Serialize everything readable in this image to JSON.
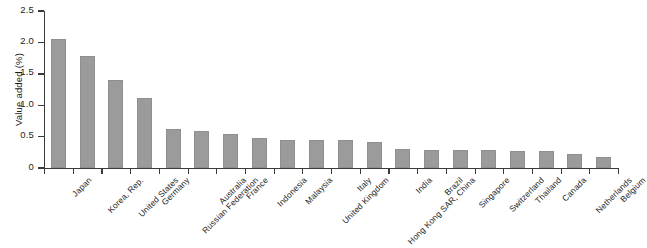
{
  "chart_data": {
    "type": "bar",
    "title": "",
    "subtitle": "",
    "xlabel": "",
    "ylabel": "Value added (%)",
    "ylim": [
      0,
      2.5
    ],
    "yticks": [
      0,
      0.5,
      1.0,
      1.5,
      2.0,
      2.5
    ],
    "ytick_labels": [
      "0",
      "0.5",
      "1.0",
      "1.5",
      "2.0",
      "2.5"
    ],
    "grid": false,
    "legend": null,
    "bar_color": "#9b9b9b",
    "axis_color": "#3a3a3a",
    "categories": [
      "Japan",
      "Korea, Rep.",
      "United States",
      "Germany",
      "Russian Federation",
      "Australia",
      "France",
      "Indonesia",
      "Malaysia",
      "United Kingdom",
      "Italy",
      "Hong Kong SAR, China",
      "India",
      "Brazil",
      "Singapore",
      "Switzerland",
      "Thailand",
      "Canada",
      "Netherlands",
      "Belgium"
    ],
    "values": [
      2.05,
      1.79,
      1.4,
      1.11,
      0.62,
      0.59,
      0.54,
      0.47,
      0.45,
      0.45,
      0.44,
      0.42,
      0.31,
      0.29,
      0.28,
      0.28,
      0.27,
      0.27,
      0.22,
      0.18
    ]
  }
}
